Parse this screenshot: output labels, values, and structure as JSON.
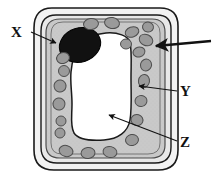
{
  "diagram": {
    "type": "biology-labelled-diagram",
    "canvas": {
      "width": 214,
      "height": 181
    },
    "background_color": "#ffffff",
    "structures": [
      {
        "id": "cell-wall-outer",
        "name": "cell wall outer boundary",
        "fill": "#f2f2f2",
        "stroke": "#1a1a1a",
        "description": "outermost rounded-rectangle outline of the plant cell"
      },
      {
        "id": "cell-wall-inner",
        "name": "cell wall inner boundary",
        "fill": "#e6e6e6",
        "stroke": "#1a1a1a",
        "description": "second rounded-rectangle line forming the thick cell wall band"
      },
      {
        "id": "cell-membrane",
        "name": "cell membrane",
        "fill": "#c9c9c9",
        "stroke": "#4d4d4d",
        "description": "thin line just inside the cell wall enclosing the cytoplasm"
      },
      {
        "id": "cytoplasm",
        "name": "cytoplasm",
        "fill": "#c9c9c9",
        "stroke": "#4d4d4d",
        "description": "stippled grey band between membrane and central vacuole"
      },
      {
        "id": "vacuole",
        "name": "central vacuole",
        "fill": "#ffffff",
        "stroke": "#1a1a1a",
        "description": "large irregular white space filling the middle of the cell"
      },
      {
        "id": "nucleus",
        "name": "nucleus",
        "fill": "#111111",
        "stroke": "#000000",
        "description": "solid black oval at the upper-left of the cytoplasm"
      },
      {
        "id": "chloroplasts",
        "name": "chloroplasts",
        "fill": "#9a9a9a",
        "stroke": "#4d4d4d",
        "count": 22,
        "description": "small grey ovals scattered around the cytoplasm band"
      }
    ],
    "labels": [
      {
        "id": "x",
        "text": "X",
        "points_to": "nucleus",
        "position": "upper-left"
      },
      {
        "id": "y",
        "text": "Y",
        "points_to": "cell-wall",
        "position": "right-middle"
      },
      {
        "id": "z",
        "text": "Z",
        "points_to": "vacuole",
        "position": "right-lower"
      }
    ],
    "leaders": [
      {
        "id": "leader-x",
        "label": "X",
        "from": [
          31,
          33
        ],
        "to": [
          58,
          44
        ],
        "arrowhead": "solid-triangle",
        "color": "#111111"
      },
      {
        "id": "leader-unlabelled",
        "label": "",
        "from": [
          210,
          42
        ],
        "to": [
          156,
          45
        ],
        "arrowhead": "solid-triangle",
        "color": "#111111"
      },
      {
        "id": "leader-y",
        "label": "Y",
        "from": [
          177,
          90
        ],
        "to": [
          140,
          87
        ],
        "arrowhead": "solid-triangle",
        "color": "#111111"
      },
      {
        "id": "leader-z",
        "label": "Z",
        "from": [
          177,
          140
        ],
        "to": [
          110,
          116
        ],
        "arrowhead": "solid-triangle",
        "color": "#111111"
      }
    ],
    "chloroplast_positions": [
      {
        "cx": 91,
        "cy": 24,
        "rx": 7.5,
        "ry": 5.5,
        "rot": -8
      },
      {
        "cx": 112,
        "cy": 23,
        "rx": 7.5,
        "ry": 5.5,
        "rot": 10
      },
      {
        "cx": 132,
        "cy": 32,
        "rx": 7,
        "ry": 5,
        "rot": -20
      },
      {
        "cx": 146,
        "cy": 38,
        "rx": 7,
        "ry": 5.5,
        "rot": 25
      },
      {
        "cx": 139,
        "cy": 50,
        "rx": 6,
        "ry": 5,
        "rot": -15
      },
      {
        "cx": 145,
        "cy": 64,
        "rx": 5.5,
        "ry": 6,
        "rot": 20
      },
      {
        "cx": 143,
        "cy": 80,
        "rx": 5.5,
        "ry": 6.5,
        "rot": 8
      },
      {
        "cx": 140,
        "cy": 101,
        "rx": 6,
        "ry": 5.5,
        "rot": -12
      },
      {
        "cx": 136,
        "cy": 120,
        "rx": 6,
        "ry": 5.5,
        "rot": 18
      },
      {
        "cx": 131,
        "cy": 140,
        "rx": 6.5,
        "ry": 5.5,
        "rot": -10
      },
      {
        "cx": 110,
        "cy": 152,
        "rx": 7,
        "ry": 5.5,
        "rot": 12
      },
      {
        "cx": 88,
        "cy": 153,
        "rx": 7,
        "ry": 5.5,
        "rot": -6
      },
      {
        "cx": 66,
        "cy": 151,
        "rx": 7,
        "ry": 5.5,
        "rot": 15
      },
      {
        "cx": 60,
        "cy": 133,
        "rx": 5,
        "ry": 5,
        "rot": 0
      },
      {
        "cx": 61,
        "cy": 121,
        "rx": 5,
        "ry": 5,
        "rot": 0
      },
      {
        "cx": 59,
        "cy": 104,
        "rx": 6,
        "ry": 6,
        "rot": -10
      },
      {
        "cx": 60,
        "cy": 86,
        "rx": 6,
        "ry": 6,
        "rot": 10
      },
      {
        "cx": 63,
        "cy": 71,
        "rx": 5.5,
        "ry": 5.5,
        "rot": 0
      },
      {
        "cx": 62,
        "cy": 58,
        "rx": 6.5,
        "ry": 5.5,
        "rot": -15
      },
      {
        "cx": 126,
        "cy": 44,
        "rx": 5.5,
        "ry": 5,
        "rot": 0
      },
      {
        "cx": 148,
        "cy": 27,
        "rx": 5.5,
        "ry": 5,
        "rot": 15
      },
      {
        "cx": 103,
        "cy": 160,
        "rx": 5,
        "ry": 4,
        "rot": 0
      }
    ]
  }
}
